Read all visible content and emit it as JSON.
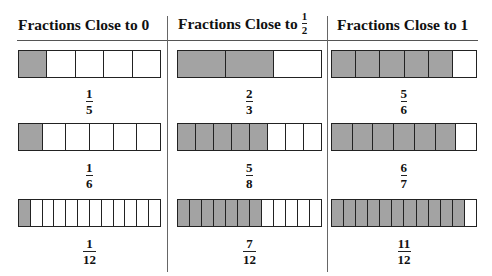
{
  "columns": [
    {
      "title": "Fractions Close to 0",
      "title_fraction": null,
      "items": [
        {
          "numerator": "1",
          "denominator": "5",
          "shaded": 1,
          "parts": 5
        },
        {
          "numerator": "1",
          "denominator": "6",
          "shaded": 1,
          "parts": 6
        },
        {
          "numerator": "1",
          "denominator": "12",
          "shaded": 1,
          "parts": 12
        }
      ]
    },
    {
      "title": "Fractions Close to",
      "title_fraction": {
        "numerator": "1",
        "denominator": "2"
      },
      "items": [
        {
          "numerator": "2",
          "denominator": "3",
          "shaded": 2,
          "parts": 3
        },
        {
          "numerator": "5",
          "denominator": "8",
          "shaded": 5,
          "parts": 8
        },
        {
          "numerator": "7",
          "denominator": "12",
          "shaded": 7,
          "parts": 12
        }
      ]
    },
    {
      "title": "Fractions Close to 1",
      "title_fraction": null,
      "items": [
        {
          "numerator": "5",
          "denominator": "6",
          "shaded": 5,
          "parts": 6
        },
        {
          "numerator": "6",
          "denominator": "7",
          "shaded": 6,
          "parts": 7
        },
        {
          "numerator": "11",
          "denominator": "12",
          "shaded": 11,
          "parts": 12
        }
      ]
    }
  ],
  "colors": {
    "shaded": "#a3a3a3",
    "unshaded": "#ffffff",
    "outline": "#222222"
  }
}
